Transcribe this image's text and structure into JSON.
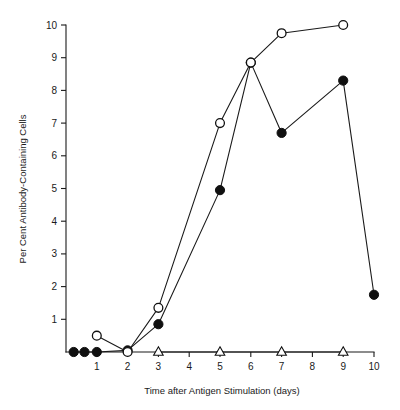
{
  "chart_data": {
    "type": "line",
    "title": "",
    "subtitle": "",
    "xlabel": "Time after Antigen Stimulation (days)",
    "ylabel": "Per Cent Antibody-Containing Cells",
    "xlim": [
      0,
      10
    ],
    "ylim": [
      0,
      10
    ],
    "grid": false,
    "legend_position": "none",
    "x_ticks": [
      1,
      2,
      3,
      4,
      5,
      6,
      7,
      8,
      9,
      10
    ],
    "x_tick_labels": [
      "1",
      "2",
      "3",
      "4",
      "5",
      "6",
      "7",
      "8",
      "9",
      "10"
    ],
    "y_ticks": [
      1,
      2,
      3,
      4,
      5,
      6,
      7,
      8,
      9,
      10
    ],
    "y_tick_labels": [
      "1",
      "2",
      "3",
      "4",
      "5",
      "6",
      "7",
      "8",
      "9",
      "10"
    ],
    "series": [
      {
        "name": "filled-circle-series",
        "marker": "filled-circle",
        "x": [
          0.25,
          0.6,
          1.0,
          2.0,
          3.0,
          5.0,
          6.0,
          7.0,
          9.0,
          10.0
        ],
        "values": [
          0.0,
          0.0,
          0.0,
          0.05,
          0.85,
          4.95,
          8.85,
          6.7,
          8.3,
          1.75
        ]
      },
      {
        "name": "open-circle-series",
        "marker": "open-circle",
        "x": [
          1.0,
          2.0,
          3.0,
          5.0,
          6.0,
          7.0,
          9.0
        ],
        "values": [
          0.5,
          0.0,
          1.35,
          7.0,
          8.85,
          9.75,
          10.0
        ]
      },
      {
        "name": "open-triangle-series",
        "marker": "open-triangle",
        "x": [
          3.0,
          5.0,
          7.0,
          9.0
        ],
        "values": [
          0.0,
          0.0,
          0.0,
          0.0
        ]
      }
    ],
    "colors": {
      "axis": "#1a1a1a",
      "line": "#1a1a1a",
      "filled_marker": "#101010",
      "open_marker_fill": "#ffffff",
      "background": "#ffffff"
    }
  }
}
